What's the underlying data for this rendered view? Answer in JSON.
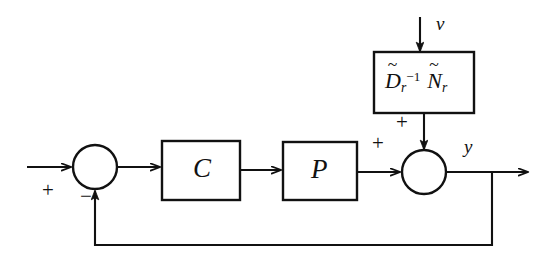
{
  "figure": {
    "type": "block-diagram",
    "domain": "control-systems",
    "background_color": "#ffffff",
    "stroke_color": "#111111",
    "canvas": {
      "width": 544,
      "height": 264
    }
  },
  "blocks": [
    {
      "id": "controller",
      "label": "C",
      "shape": "rectangle",
      "x": 162,
      "y": 141,
      "width": 78,
      "height": 59
    },
    {
      "id": "plant",
      "label": "P",
      "shape": "rectangle",
      "x": 283,
      "y": 142,
      "width": 74,
      "height": 58
    },
    {
      "id": "noise-model",
      "label_parts": {
        "first_symbol": "D",
        "first_tilde": "~",
        "first_subscript": "r",
        "first_superscript": "−1",
        "second_symbol": "N",
        "second_tilde": "~",
        "second_subscript": "r"
      },
      "label_text": "D̃_r^{-1} Ñ_r",
      "shape": "rectangle",
      "x": 374,
      "y": 52,
      "width": 100,
      "height": 61
    }
  ],
  "summing_junctions": [
    {
      "id": "error-junction",
      "shape": "circle",
      "cx": 95,
      "cy": 167,
      "r": 22,
      "signs": [
        {
          "label": "+",
          "input": "reference",
          "x": 44,
          "y": 181
        },
        {
          "label": "−",
          "input": "feedback",
          "x": 82,
          "y": 190
        }
      ]
    },
    {
      "id": "output-junction",
      "shape": "circle",
      "cx": 424,
      "cy": 172,
      "r": 22,
      "signs": [
        {
          "label": "+",
          "input": "plant-output",
          "x": 374,
          "y": 134
        },
        {
          "label": "+",
          "input": "noise",
          "x": 398,
          "y": 113
        }
      ]
    }
  ],
  "signals": [
    {
      "id": "reference-input",
      "label": "",
      "from": "external-left",
      "to": "error-junction",
      "arrow": true
    },
    {
      "id": "disturbance-input",
      "label": "v",
      "label_x": 436,
      "label_y": 16,
      "from": "external-top",
      "to": "noise-model",
      "arrow": true
    },
    {
      "id": "output",
      "label": "y",
      "label_x": 464,
      "label_y": 137,
      "from": "output-junction",
      "to": "external-right",
      "arrow": true
    },
    {
      "id": "error-to-controller",
      "label": "",
      "from": "error-junction",
      "to": "controller",
      "arrow": true
    },
    {
      "id": "controller-to-plant",
      "label": "",
      "from": "controller",
      "to": "plant",
      "arrow": true
    },
    {
      "id": "plant-to-output-junction",
      "label": "",
      "from": "plant",
      "to": "output-junction",
      "arrow": true
    },
    {
      "id": "noise-to-output-junction",
      "label": "",
      "from": "noise-model",
      "to": "output-junction",
      "arrow": true
    },
    {
      "id": "feedback-path",
      "label": "",
      "from": "output",
      "to": "error-junction",
      "arrow": true
    }
  ]
}
